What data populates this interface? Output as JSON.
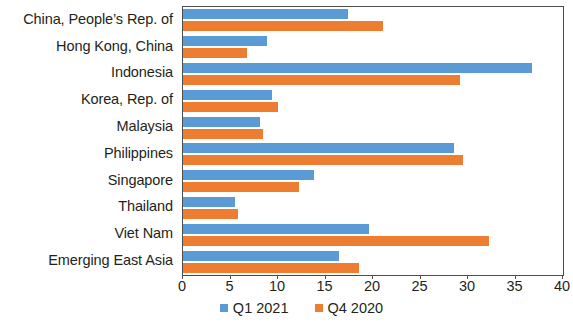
{
  "chart_data": {
    "type": "bar",
    "orientation": "horizontal",
    "title": "",
    "xlabel": "",
    "ylabel": "",
    "xlim": [
      0,
      40
    ],
    "xticks": [
      0,
      5,
      10,
      15,
      20,
      25,
      30,
      35,
      40
    ],
    "grid": false,
    "legend_position": "bottom",
    "categories": [
      "China, People’s Rep. of",
      "Hong Kong, China",
      "Indonesia",
      "Korea, Rep. of",
      "Malaysia",
      "Philippines",
      "Singapore",
      "Thailand",
      "Viet Nam",
      "Emerging East Asia"
    ],
    "series": [
      {
        "name": "Q1 2021",
        "color": "#5B9BD5",
        "values": [
          17.4,
          8.8,
          36.7,
          9.4,
          8.1,
          28.5,
          13.8,
          5.5,
          19.6,
          16.4
        ]
      },
      {
        "name": "Q4 2020",
        "color": "#ED7D31",
        "values": [
          21.0,
          6.7,
          29.2,
          10.0,
          8.4,
          29.5,
          12.2,
          5.8,
          32.2,
          18.5
        ]
      }
    ]
  },
  "axis": {
    "tick_labels": [
      "0",
      "5",
      "10",
      "15",
      "20",
      "25",
      "30",
      "35",
      "40"
    ]
  },
  "legend": {
    "items": [
      {
        "label": "Q1 2021",
        "color": "#5B9BD5"
      },
      {
        "label": "Q4 2020",
        "color": "#ED7D31"
      }
    ]
  },
  "colors": {
    "series_q1": "#5B9BD5",
    "series_q4": "#ED7D31",
    "axis_line": "#4d4d4d",
    "text": "#231f20",
    "background": "#ffffff"
  }
}
